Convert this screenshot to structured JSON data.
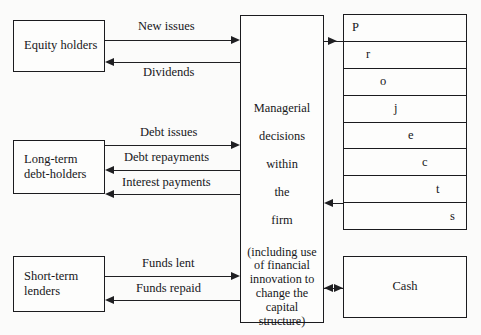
{
  "diagram": {
    "parties": [
      {
        "id": "equity-holders",
        "label": "Equity holders"
      },
      {
        "id": "long-term-debt",
        "label": "Long-term\ndebt-holders"
      },
      {
        "id": "short-term-lenders",
        "label": "Short-term\nlenders"
      }
    ],
    "center": {
      "id": "managerial-decisions",
      "lines": [
        "Managerial",
        "decisions",
        "within",
        "the",
        "firm"
      ],
      "parenthetical": "(including use\nof financial\ninnovation to\nchange the\ncapital\nstructure)"
    },
    "projects": {
      "id": "projects-stack",
      "word": "Projects",
      "rows": [
        {
          "letter": "P",
          "indent": 8
        },
        {
          "letter": "r",
          "indent": 22
        },
        {
          "letter": "o",
          "indent": 36
        },
        {
          "letter": "j",
          "indent": 50
        },
        {
          "letter": "e",
          "indent": 64
        },
        {
          "letter": "c",
          "indent": 78
        },
        {
          "letter": "t",
          "indent": 92
        },
        {
          "letter": "s",
          "indent": 106
        }
      ]
    },
    "cash": {
      "id": "cash-box",
      "label": "Cash"
    },
    "flows": [
      {
        "id": "new-issues",
        "label": "New issues",
        "from": "equity-holders",
        "to": "managerial-decisions",
        "direction": "right"
      },
      {
        "id": "dividends",
        "label": "Dividends",
        "from": "managerial-decisions",
        "to": "equity-holders",
        "direction": "left"
      },
      {
        "id": "debt-issues",
        "label": "Debt issues",
        "from": "long-term-debt",
        "to": "managerial-decisions",
        "direction": "right"
      },
      {
        "id": "debt-repayments",
        "label": "Debt repayments",
        "from": "managerial-decisions",
        "to": "long-term-debt",
        "direction": "left"
      },
      {
        "id": "interest-payments",
        "label": "Interest payments",
        "from": "managerial-decisions",
        "to": "long-term-debt",
        "direction": "left"
      },
      {
        "id": "funds-lent",
        "label": "Funds lent",
        "from": "short-term-lenders",
        "to": "managerial-decisions",
        "direction": "right"
      },
      {
        "id": "funds-repaid",
        "label": "Funds repaid",
        "from": "managerial-decisions",
        "to": "short-term-lenders",
        "direction": "left"
      },
      {
        "id": "investment-in-projects",
        "label": "",
        "from": "managerial-decisions",
        "to": "projects-stack",
        "direction": "right"
      },
      {
        "id": "returns-from-projects",
        "label": "",
        "from": "projects-stack",
        "to": "managerial-decisions",
        "direction": "left"
      },
      {
        "id": "cash-flow",
        "label": "",
        "from": "managerial-decisions",
        "to": "cash-box",
        "direction": "both"
      }
    ],
    "colors": {
      "stroke": "#1f1f22",
      "text": "#17171a",
      "background": "#fbfbfa",
      "box_fill": "#fdfdfc"
    }
  }
}
